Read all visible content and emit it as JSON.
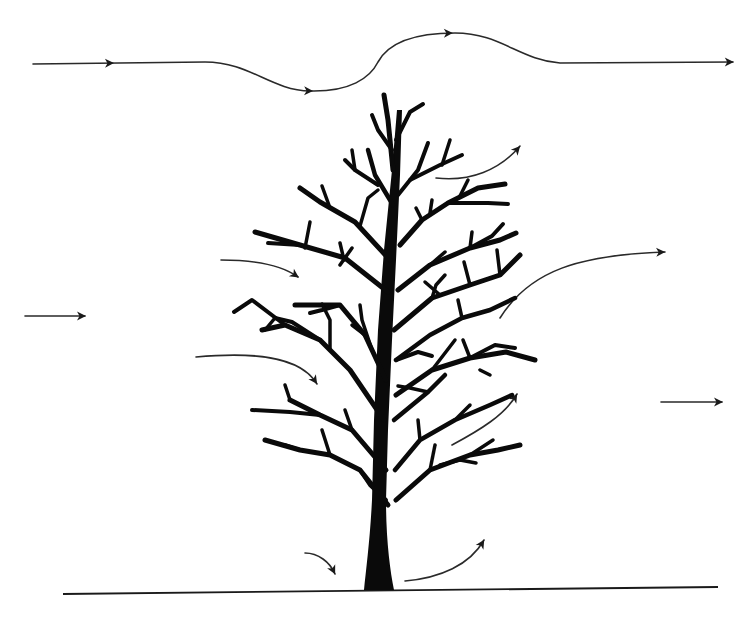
{
  "diagram": {
    "colors": {
      "background": "#ffffff",
      "ink": "#0a0a0a",
      "arrow": "#2a2a2a"
    },
    "ground_line": {
      "x1": 63,
      "y1": 594,
      "x2": 718,
      "y2": 587
    },
    "arrows": [
      {
        "id": "top-streamline",
        "d": "M33,64 L205,62 C250,62 270,90 310,91 C350,92 370,78 378,62 C390,40 420,33 455,33 C500,33 520,60 560,63 L733,62",
        "heads": [
          [
            113,
            62
          ],
          [
            312,
            91
          ],
          [
            452,
            33
          ],
          [
            733,
            62
          ]
        ]
      },
      {
        "id": "upper-right-over-crown",
        "d": "M436,178 C470,182 500,170 520,146",
        "heads": [
          [
            520,
            146
          ]
        ]
      },
      {
        "id": "left-into-crown-upper",
        "d": "M221,260 C250,260 280,264 298,277",
        "heads": [
          [
            298,
            277
          ]
        ]
      },
      {
        "id": "right-lift-out",
        "d": "M500,318 C530,270 580,255 665,252",
        "heads": [
          [
            665,
            252
          ]
        ]
      },
      {
        "id": "left-free-stream",
        "d": "M25,316 L85,316",
        "heads": [
          [
            85,
            316
          ]
        ]
      },
      {
        "id": "left-into-crown-lower",
        "d": "M196,357 C250,352 300,355 317,384",
        "heads": [
          [
            317,
            384
          ]
        ]
      },
      {
        "id": "right-within-crown",
        "d": "M452,445 C480,430 505,415 517,394",
        "heads": [
          [
            517,
            394
          ]
        ]
      },
      {
        "id": "right-free-stream",
        "d": "M661,402 L722,402",
        "heads": [
          [
            722,
            402
          ]
        ]
      },
      {
        "id": "base-left-down",
        "d": "M305,553 C318,553 330,562 335,574",
        "heads": [
          [
            335,
            574
          ]
        ]
      },
      {
        "id": "base-right-up",
        "d": "M405,581 C440,578 470,565 484,540",
        "heads": [
          [
            484,
            540
          ]
        ]
      }
    ],
    "tree": {
      "trunk_path": "M364,590 C366,570 370,540 372,500 L374,420 L378,330 L384,250 L392,170 L397,110 L402,110 L400,175 L396,260 L392,340 L388,430 L386,500 C386,540 390,570 394,590 Z",
      "branches": [
        {
          "d": "M393,170 L388,120 L384,95",
          "w": 5
        },
        {
          "d": "M396,140 L410,112 L423,104",
          "w": 4
        },
        {
          "d": "M392,150 L378,130 L372,115",
          "w": 4
        },
        {
          "d": "M393,205 L375,175 L368,150",
          "w": 4.5
        },
        {
          "d": "M378,185 L355,170 L345,160",
          "w": 4
        },
        {
          "d": "M355,170 L352,150",
          "w": 3.5
        },
        {
          "d": "M398,195 L418,170 L428,143",
          "w": 4
        },
        {
          "d": "M410,180 L440,165 L462,155",
          "w": 4
        },
        {
          "d": "M442,165 L450,140",
          "w": 3.5
        },
        {
          "d": "M390,260 L355,222 L320,202 L300,188",
          "w": 5
        },
        {
          "d": "M330,208 L322,186",
          "w": 3.5
        },
        {
          "d": "M360,226 L368,198 L378,190",
          "w": 3.5
        },
        {
          "d": "M388,292 L345,258 L300,245 L255,232",
          "w": 5
        },
        {
          "d": "M300,245 L268,243",
          "w": 4
        },
        {
          "d": "M305,248 L310,222",
          "w": 3.5
        },
        {
          "d": "M344,260 L340,243",
          "w": 3.5
        },
        {
          "d": "M340,265 L352,248",
          "w": 3.5
        },
        {
          "d": "M400,245 L422,220 L448,203 L478,188 L505,184",
          "w": 5
        },
        {
          "d": "M448,203 L488,203 L508,204",
          "w": 4
        },
        {
          "d": "M422,220 L416,208",
          "w": 3.5
        },
        {
          "d": "M430,213 L432,200",
          "w": 3.5
        },
        {
          "d": "M460,196 L468,180",
          "w": 3.5
        },
        {
          "d": "M398,290 L430,265 L470,248 L500,240 L516,233",
          "w": 5
        },
        {
          "d": "M470,248 L492,236 L503,224",
          "w": 4
        },
        {
          "d": "M430,265 L445,252",
          "w": 3.5
        },
        {
          "d": "M470,248 L472,232",
          "w": 3.5
        },
        {
          "d": "M394,330 L432,298 L470,285 L500,275 L520,255",
          "w": 5
        },
        {
          "d": "M500,275 L497,250",
          "w": 3.5
        },
        {
          "d": "M470,285 L464,262",
          "w": 3.5
        },
        {
          "d": "M432,298 L436,285 L445,275",
          "w": 3.5
        },
        {
          "d": "M440,295 L425,282",
          "w": 3.5
        },
        {
          "d": "M386,380 L365,335 L340,305 L295,305",
          "w": 5
        },
        {
          "d": "M340,305 L322,310 L310,313",
          "w": 4
        },
        {
          "d": "M365,335 L352,325",
          "w": 3.5
        },
        {
          "d": "M372,350 L362,320 L360,305",
          "w": 3.5
        },
        {
          "d": "M384,420 L350,370 L320,340 L285,325 L262,330",
          "w": 5
        },
        {
          "d": "M320,340 L292,322 L275,318",
          "w": 4
        },
        {
          "d": "M285,325 L252,300 L234,312",
          "w": 4
        },
        {
          "d": "M275,318 L265,330",
          "w": 3.5
        },
        {
          "d": "M330,350 L330,320 L322,304",
          "w": 3.5
        },
        {
          "d": "M396,360 L430,335 L462,318 L490,310 L515,298",
          "w": 4.5
        },
        {
          "d": "M396,360 L418,352 L432,356",
          "w": 4
        },
        {
          "d": "M462,318 L458,300",
          "w": 3.5
        },
        {
          "d": "M396,395 L432,370 L470,358 L506,352 L535,360",
          "w": 5
        },
        {
          "d": "M470,358 L495,345 L515,348",
          "w": 4
        },
        {
          "d": "M470,358 L463,340",
          "w": 3.5
        },
        {
          "d": "M480,370 L490,375",
          "w": 3.5
        },
        {
          "d": "M432,370 L455,340",
          "w": 3.5
        },
        {
          "d": "M394,420 L428,392 L445,375",
          "w": 4.5
        },
        {
          "d": "M428,392 L410,388 L398,386",
          "w": 3.5
        },
        {
          "d": "M386,470 L352,430 L320,415 L290,400",
          "w": 5
        },
        {
          "d": "M320,415 L290,412 L252,410",
          "w": 4
        },
        {
          "d": "M290,400 L285,385",
          "w": 3.5
        },
        {
          "d": "M352,430 L345,410",
          "w": 3.5
        },
        {
          "d": "M388,505 L360,470 L330,455 L300,450 L265,440",
          "w": 5
        },
        {
          "d": "M330,455 L322,430",
          "w": 3.5
        },
        {
          "d": "M300,450 L285,445",
          "w": 3.5
        },
        {
          "d": "M395,470 L420,440 L455,420 L490,405 L512,395",
          "w": 4.5
        },
        {
          "d": "M455,420 L470,405",
          "w": 3.5
        },
        {
          "d": "M420,440 L418,420",
          "w": 3.5
        },
        {
          "d": "M396,500 L430,470 L470,455 L498,450 L520,445",
          "w": 5
        },
        {
          "d": "M470,455 L493,440",
          "w": 3.5
        },
        {
          "d": "M430,470 L435,445",
          "w": 3.5
        },
        {
          "d": "M440,465 L460,460 L476,463",
          "w": 3.5
        },
        {
          "d": "M386,500 L370,485 L360,470",
          "w": 4
        }
      ]
    }
  }
}
